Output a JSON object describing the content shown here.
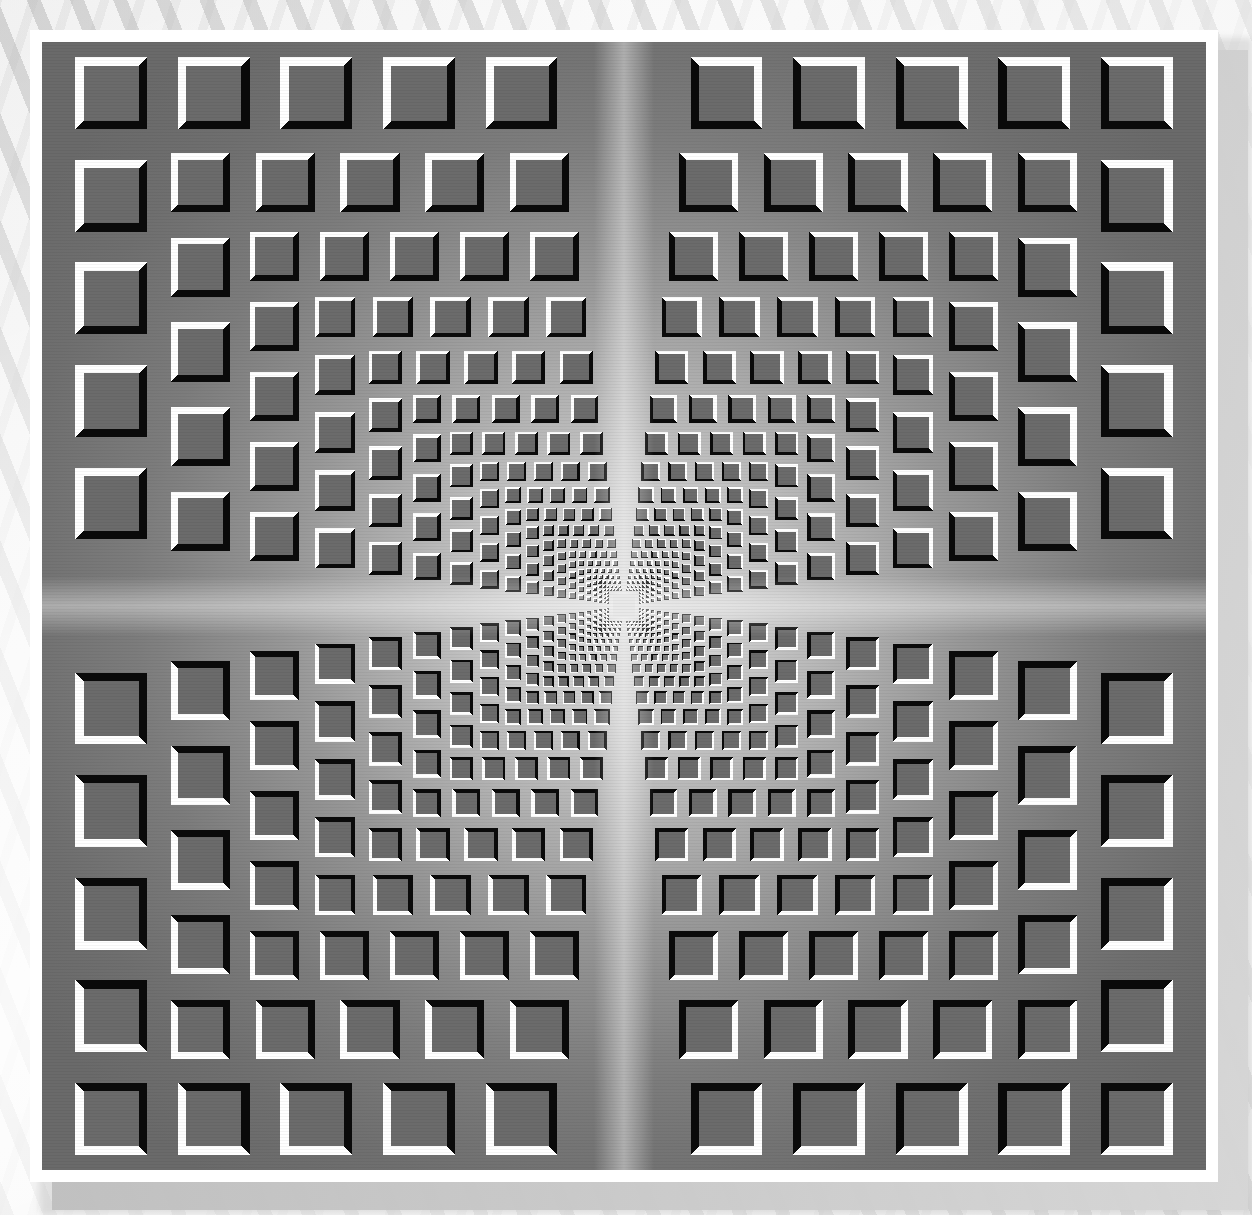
{
  "artwork": {
    "title_clipped_fragment": "r u",
    "kind": "op-art-nested-squares-illusion",
    "description": "Vasarely-style concentric square grid optical illusion with beveled tiles receding toward a bright center",
    "plate": {
      "x": 42,
      "y": 42,
      "width": 1164,
      "height": 1128,
      "mat_x": 30,
      "mat_y": 30,
      "mat_width": 1188,
      "mat_height": 1152
    },
    "center": {
      "x": 582,
      "y": 564
    },
    "colors": {
      "tile_face": "#6b6b6b",
      "tile_face_inner": "#7a7a7a",
      "tile_highlight": "#ffffff",
      "tile_shadow": "#0a0a0a",
      "panel_outer": "#6e6e6e",
      "panel_mid": "#9a9a9a",
      "panel_center": "#d8d8d8",
      "mat": "#ffffff",
      "page_background": "#f0f0f0",
      "page_stripe": "#c8c8c8",
      "plate_drop_shadow": "#c0c0c0"
    },
    "geometry": {
      "rings": 26,
      "ring_step": 0.826,
      "outer_half_extent": 564,
      "tiles_per_side_outer": 11,
      "tile_fill_ratio": 0.7,
      "bevel_ratio": 0.115,
      "center_square_size": 22,
      "cross_band_width": 34
    },
    "bevel_rule": "highlight faces toward the outside of the plate; shadow faces toward the center",
    "quadrants": [
      {
        "name": "top-left",
        "highlight_corner": "top-left",
        "shadow_corner": "bottom-right"
      },
      {
        "name": "top-right",
        "highlight_corner": "top-right",
        "shadow_corner": "bottom-left"
      },
      {
        "name": "bottom-left",
        "highlight_corner": "bottom-left",
        "shadow_corner": "top-right"
      },
      {
        "name": "bottom-right",
        "highlight_corner": "bottom-right",
        "shadow_corner": "top-left"
      }
    ]
  }
}
